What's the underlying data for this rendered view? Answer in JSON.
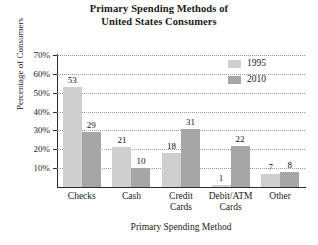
{
  "chart_data": {
    "type": "bar",
    "title": "Primary Spending Methods of United States Consumers",
    "title_line1": "Primary Spending Methods of",
    "title_line2": "United States Consumers",
    "xlabel": "Primary Spending Method",
    "ylabel": "Percentage of Consumers",
    "categories": [
      "Checks",
      "Cash",
      "Credit Cards",
      "Debit/ATM Cards",
      "Other"
    ],
    "category_lines": [
      [
        "Checks"
      ],
      [
        "Cash"
      ],
      [
        "Credit",
        "Cards"
      ],
      [
        "Debit/ATM",
        "Cards"
      ],
      [
        "Other"
      ]
    ],
    "series": [
      {
        "name": "1995",
        "color": "#cfcfcf",
        "values": [
          53,
          21,
          18,
          1,
          7
        ]
      },
      {
        "name": "2010",
        "color": "#a6a6a6",
        "values": [
          29,
          10,
          31,
          22,
          8
        ]
      }
    ],
    "ylim": [
      0,
      70
    ],
    "ytick_labels": [
      "70%",
      "60%",
      "50%",
      "40%",
      "30%",
      "20%",
      "10%"
    ],
    "ytick_values": [
      70,
      60,
      50,
      40,
      30,
      20,
      10
    ],
    "grid": true,
    "legend_position": "top-right",
    "legend": [
      {
        "label": "1995",
        "color": "#cfcfcf"
      },
      {
        "label": "2010",
        "color": "#a6a6a6"
      }
    ]
  }
}
